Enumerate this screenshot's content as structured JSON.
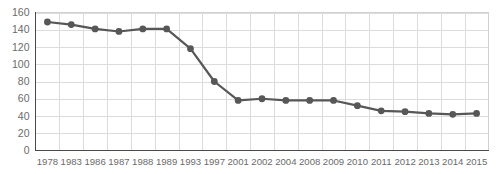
{
  "chart_data": {
    "type": "line",
    "title": "",
    "subtitle": "",
    "xlabel": "",
    "ylabel": "",
    "categories": [
      "1978",
      "1983",
      "1986",
      "1987",
      "1988",
      "1989",
      "1993",
      "1997",
      "2001",
      "2002",
      "2004",
      "2008",
      "2009",
      "2010",
      "2011",
      "2012",
      "2013",
      "2014",
      "2015"
    ],
    "values": [
      149,
      146,
      141,
      138,
      141,
      141,
      118,
      80,
      58,
      60,
      58,
      58,
      58,
      52,
      46,
      45,
      43,
      42,
      43
    ],
    "series": [
      {
        "name": "",
        "values": [
          149,
          146,
          141,
          138,
          141,
          141,
          118,
          80,
          58,
          60,
          58,
          58,
          58,
          52,
          46,
          45,
          43,
          42,
          43
        ]
      }
    ],
    "ylim": [
      0,
      160
    ],
    "y_ticks": [
      0,
      20,
      40,
      60,
      80,
      100,
      120,
      140,
      160
    ],
    "y_tick_labels": [
      "0",
      "20",
      "40",
      "60",
      "80",
      "100",
      "120",
      "140",
      "160"
    ],
    "x_tick_labels": [
      "1978",
      "1983",
      "1986",
      "1987",
      "1988",
      "1989",
      "1993",
      "1997",
      "2001",
      "2002",
      "2004",
      "2008",
      "2009",
      "2010",
      "2011",
      "2012",
      "2013",
      "2014",
      "2015"
    ],
    "grid": true,
    "grid_axis": "both",
    "legend": false,
    "legend_position": "none",
    "marker": "circle",
    "colors": {
      "line": "#575757",
      "marker": "#575757",
      "grid": "#dcdcdc",
      "axis": "#4a4a4a",
      "tick_text": "#6b6b6b",
      "background": "#ffffff",
      "plot_border": "#d2d2d2"
    }
  }
}
